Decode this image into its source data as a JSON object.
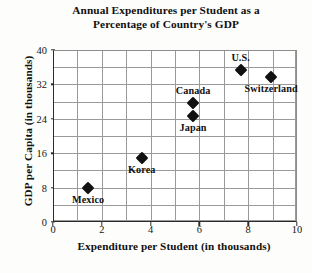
{
  "chart_data": {
    "type": "scatter",
    "title": "Annual Expenditures per Student as a Percentage of Country's GDP",
    "title_lines": [
      "Annual Expenditures per Student as a",
      "Percentage of Country's GDP"
    ],
    "xlabel": "Expenditure per Student (in thousands)",
    "ylabel": "GDP per Capita (in thousands)",
    "xlim": [
      0,
      10
    ],
    "ylim": [
      0,
      40
    ],
    "xticks": [
      0,
      2,
      4,
      6,
      8,
      10
    ],
    "yticks": [
      0,
      8,
      16,
      24,
      32,
      40
    ],
    "xtick_labels": [
      "0",
      "2",
      "4",
      "6",
      "8",
      "10"
    ],
    "ytick_labels": [
      "0",
      "8",
      "16",
      "24",
      "32",
      "40"
    ],
    "grid": true,
    "grid_step_x": 1,
    "grid_step_y": 4,
    "legend": "none",
    "marker": "diamond",
    "marker_color": "#111111",
    "points": [
      {
        "label": "Mexico",
        "x": 1.4,
        "y": 8.2,
        "label_pos": "below"
      },
      {
        "label": "Korea",
        "x": 3.6,
        "y": 15.1,
        "label_pos": "below"
      },
      {
        "label": "Japan",
        "x": 5.7,
        "y": 25.0,
        "label_pos": "below"
      },
      {
        "label": "Canada",
        "x": 5.7,
        "y": 28.0,
        "label_pos": "above"
      },
      {
        "label": "U.S.",
        "x": 7.65,
        "y": 35.5,
        "label_pos": "above"
      },
      {
        "label": "Switzerland",
        "x": 8.9,
        "y": 34.0,
        "label_pos": "below"
      }
    ]
  }
}
